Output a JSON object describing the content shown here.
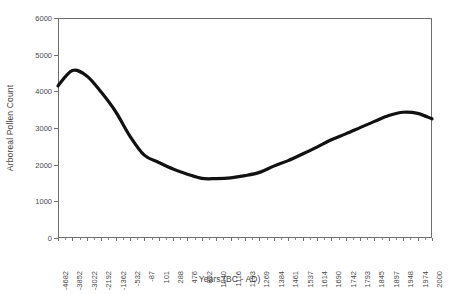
{
  "chart_data": {
    "type": "line",
    "title": "",
    "xlabel": "Years (BC - AD)",
    "ylabel": "Arboreal Pollen Count",
    "ylim": [
      0,
      6000
    ],
    "ytick_labels": [
      "0",
      "1000",
      "2000",
      "3000",
      "4000",
      "5000",
      "6000"
    ],
    "ytick_values": [
      0,
      1000,
      2000,
      3000,
      4000,
      5000,
      6000
    ],
    "grid": false,
    "legend": null,
    "categories": [
      "-4682",
      "-3852",
      "-3022",
      "-2192",
      "-1362",
      "-532",
      "-87",
      "101",
      "288",
      "476",
      "852",
      "1040",
      "1116",
      "1193",
      "1269",
      "1384",
      "1461",
      "1537",
      "1614",
      "1690",
      "1742",
      "1793",
      "1845",
      "1897",
      "1948",
      "1974",
      "2000"
    ],
    "series": [
      {
        "name": "Arboreal Pollen Count",
        "color": "#111111",
        "values": [
          4150,
          4570,
          4420,
          3980,
          3450,
          2780,
          2260,
          2060,
          1880,
          1740,
          1625,
          1620,
          1640,
          1700,
          1790,
          1960,
          2110,
          2290,
          2480,
          2680,
          2840,
          3010,
          3180,
          3340,
          3430,
          3400,
          3250
        ]
      }
    ]
  }
}
